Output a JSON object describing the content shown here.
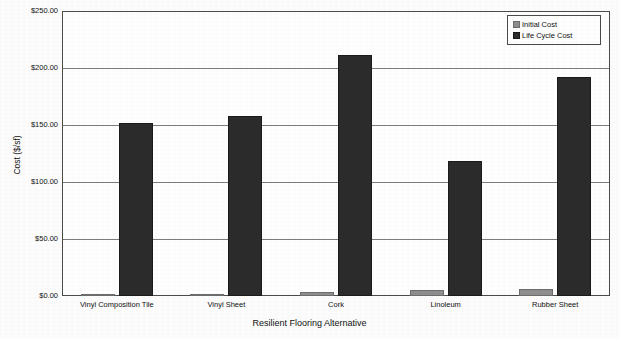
{
  "chart_data": {
    "type": "bar",
    "title": "",
    "xlabel": "Resilient Flooring Alternative",
    "ylabel": "Cost ($/sf)",
    "categories": [
      "Vinyl Composition Tile",
      "Vinyl Sheet",
      "Cork",
      "Linoleum",
      "Rubber Sheet"
    ],
    "series": [
      {
        "name": "Initial Cost",
        "values": [
          1.2,
          2.0,
          3.5,
          5.0,
          6.0
        ],
        "color": "#8e8e8e"
      },
      {
        "name": "Life Cycle Cost",
        "values": [
          152.0,
          158.0,
          211.0,
          118.0,
          192.0
        ],
        "color": "#2b2b2b"
      }
    ],
    "ylim": [
      0,
      250
    ],
    "y_ticks": [
      0,
      50,
      100,
      150,
      200,
      250
    ],
    "y_tick_labels": [
      "$0.00",
      "$50.00",
      "$100.00",
      "$150.00",
      "$200.00",
      "$250.00"
    ],
    "grid": true,
    "legend_position": "top-right"
  },
  "legend": {
    "entries": [
      {
        "label": "Initial Cost"
      },
      {
        "label": "Life Cycle Cost"
      }
    ]
  }
}
